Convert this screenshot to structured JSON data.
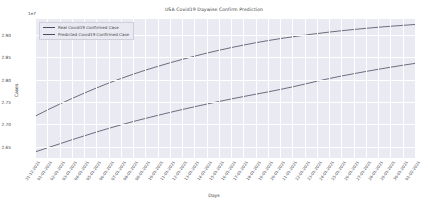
{
  "chart_data": {
    "type": "line",
    "title": "USA Covid19 Daywise Confirm Prediction",
    "xlabel": "Days",
    "ylabel": "Cases",
    "offset_label": "1e7",
    "grid": true,
    "legend_position": "upper left",
    "ylim": [
      2.625,
      2.935
    ],
    "yticks": [
      "2.65",
      "2.70",
      "2.75",
      "2.80",
      "2.85",
      "2.90"
    ],
    "ytick_values": [
      2.65,
      2.7,
      2.75,
      2.8,
      2.85,
      2.9
    ],
    "categories": [
      "31-12-2021",
      "01-01-2021",
      "02-01-2021",
      "03-01-2021",
      "04-01-2021",
      "05-01-2021",
      "06-01-2021",
      "07-01-2021",
      "08-01-2021",
      "09-01-2021",
      "10-01-2021",
      "11-01-2021",
      "12-01-2021",
      "13-01-2021",
      "14-01-2021",
      "15-01-2021",
      "16-01-2021",
      "17-01-2021",
      "18-01-2021",
      "19-01-2021",
      "20-01-2021",
      "21-01-2021",
      "22-01-2021",
      "23-01-2021",
      "24-01-2021",
      "25-01-2021",
      "26-01-2021",
      "27-01-2021",
      "28-01-2021",
      "29-01-2021",
      "30-01-2021",
      "01-02-2021"
    ],
    "series": [
      {
        "name": "Real Covid19 Confirmed Case",
        "color": "#4c4c63",
        "values": [
          2.718,
          2.732,
          2.745,
          2.7575,
          2.7695,
          2.781,
          2.792,
          2.8022,
          2.8118,
          2.8208,
          2.8292,
          2.8372,
          2.8448,
          2.852,
          2.8588,
          2.8652,
          2.8712,
          2.8768,
          2.882,
          2.8868,
          2.8912,
          2.8952,
          2.899,
          2.9025,
          2.9058,
          2.9088,
          2.9116,
          2.9142,
          2.9166,
          2.9188,
          2.9208,
          2.9228
        ]
      },
      {
        "name": "Predicted Covid19 Confirmed Case",
        "color": "#4c4c63",
        "values": [
          2.6385,
          2.6475,
          2.6565,
          2.6655,
          2.6742,
          2.6828,
          2.691,
          2.6988,
          2.7062,
          2.7132,
          2.72,
          2.7266,
          2.733,
          2.7392,
          2.7452,
          2.751,
          2.7566,
          2.762,
          2.7672,
          2.7724,
          2.7778,
          2.7836,
          2.7898,
          2.7962,
          2.8022,
          2.8078,
          2.813,
          2.818,
          2.8228,
          2.8274,
          2.8318,
          2.836
        ]
      }
    ]
  },
  "style": {
    "axes_facecolor": "#eaeaf2",
    "grid_color": "#ffffff",
    "figure_facecolor": "#ffffff",
    "text_color": "#44484d"
  }
}
